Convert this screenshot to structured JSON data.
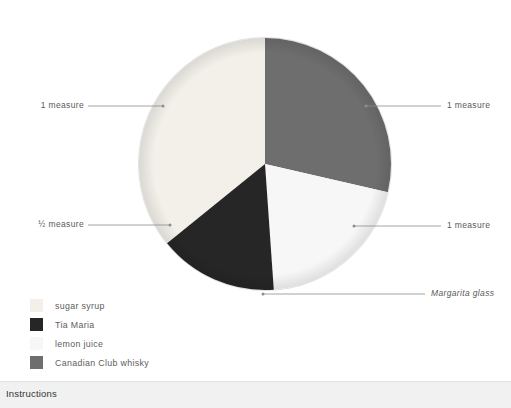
{
  "chart_data": {
    "type": "pie",
    "title": "",
    "center": {
      "x": 265,
      "y": 164
    },
    "radius": 126,
    "start_angle_deg": 0,
    "direction": "clockwise",
    "legend_position": "bottom-left",
    "grid": false,
    "categories": [
      "Canadian Club whisky",
      "lemon juice",
      "Tia Maria",
      "sugar syrup"
    ],
    "values": [
      1,
      1,
      0.5,
      1
    ],
    "value_labels": [
      "1 measure",
      "1 measure",
      "½ measure",
      "1 measure"
    ],
    "colors": [
      "#6e6e6e",
      "#f7f7f7",
      "#262626",
      "#f2f0e9"
    ],
    "angles_deg": [
      {
        "name": "Canadian Club whisky",
        "start": 0,
        "end": 103
      },
      {
        "name": "lemon juice",
        "start": 103,
        "end": 176
      },
      {
        "name": "Tia Maria",
        "start": 176,
        "end": 231
      },
      {
        "name": "sugar syrup",
        "start": 231,
        "end": 360
      }
    ],
    "annotations": [
      {
        "text": "1 measure",
        "slice": "sugar syrup",
        "side": "left"
      },
      {
        "text": "1 measure",
        "slice": "Canadian Club whisky",
        "side": "right"
      },
      {
        "text": "½ measure",
        "slice": "Tia Maria",
        "side": "left"
      },
      {
        "text": "1 measure",
        "slice": "lemon juice",
        "side": "right"
      },
      {
        "text": "Margarita glass",
        "slice": "whole-pie",
        "side": "right",
        "style": "italic"
      }
    ]
  },
  "callouts": {
    "top_left": "1 measure",
    "top_right": "1 measure",
    "bottom_left": "½ measure",
    "bottom_right": "1 measure",
    "glass": "Margarita glass"
  },
  "legend": {
    "items": [
      {
        "label": "sugar syrup",
        "color": "#f2f0e9"
      },
      {
        "label": "Tia Maria",
        "color": "#262626"
      },
      {
        "label": "lemon juice",
        "color": "#f7f7f7"
      },
      {
        "label": "Canadian Club whisky",
        "color": "#6e6e6e"
      }
    ]
  },
  "instructions": {
    "heading": "Instructions"
  }
}
